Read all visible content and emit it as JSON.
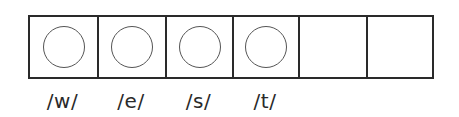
{
  "diagram": {
    "type": "sound-boxes",
    "cells": [
      {
        "has_circle": true,
        "label": "/w/"
      },
      {
        "has_circle": true,
        "label": "/e/"
      },
      {
        "has_circle": true,
        "label": "/s/"
      },
      {
        "has_circle": true,
        "label": "/t/"
      },
      {
        "has_circle": false,
        "label": ""
      },
      {
        "has_circle": false,
        "label": ""
      }
    ],
    "colors": {
      "border": "#2a2a2a",
      "circle": "#555555",
      "text": "#2a2a2a",
      "background": "#ffffff"
    }
  }
}
